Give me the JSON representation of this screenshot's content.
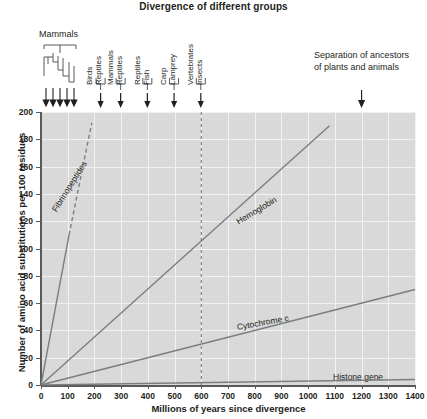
{
  "chart_data": {
    "type": "line",
    "title": "Divergence of different groups",
    "xlabel": "Millions of years since divergence",
    "ylabel": "Number of amino acid substitutions per 100 residues",
    "xlim": [
      0,
      1400
    ],
    "ylim": [
      0,
      200
    ],
    "xticks": [
      0,
      100,
      200,
      300,
      400,
      500,
      600,
      700,
      800,
      900,
      1000,
      1100,
      1200,
      1300,
      1400
    ],
    "yticks": [
      0,
      20,
      40,
      60,
      80,
      100,
      120,
      140,
      160,
      180,
      200
    ],
    "grid": true,
    "legend_position": "inline-labels",
    "series": [
      {
        "name": "Fibrinopeptides",
        "style": "solid-then-dashed",
        "solid_segment": [
          [
            0,
            0
          ],
          [
            105,
            110
          ]
        ],
        "dashed_segment": [
          [
            105,
            110
          ],
          [
            190,
            192
          ]
        ],
        "points": [
          [
            0,
            0
          ],
          [
            105,
            110
          ],
          [
            190,
            192
          ]
        ],
        "slope_per_100My": 104
      },
      {
        "name": "Hemoglobin",
        "style": "solid",
        "points": [
          [
            0,
            0
          ],
          [
            1080,
            190
          ]
        ],
        "slope_per_100My": 17.6
      },
      {
        "name": "Cytochrome c",
        "style": "solid",
        "points": [
          [
            0,
            0
          ],
          [
            1400,
            70
          ]
        ],
        "slope_per_100My": 5
      },
      {
        "name": "Histone gene",
        "style": "solid",
        "points": [
          [
            0,
            0
          ],
          [
            1400,
            4
          ]
        ],
        "slope_per_100My": 0.3
      }
    ],
    "reference_line": {
      "x": 600,
      "style": "dashed",
      "label": "Vertebrates / Insects divergence"
    },
    "divergence_markers": [
      {
        "x": 225,
        "labels": [
          "Birds",
          "Reptiles"
        ]
      },
      {
        "x": 300,
        "labels": [
          "Mammals",
          "Reptiles"
        ]
      },
      {
        "x": 400,
        "labels": [
          "Reptiles",
          "Fish"
        ]
      },
      {
        "x": 500,
        "labels": [
          "Carp",
          "Lamprey"
        ]
      },
      {
        "x": 600,
        "labels": [
          "Vertebrates",
          "Insects"
        ]
      },
      {
        "x": 1200,
        "labels": [
          "Separation of ancestors of plants and animals"
        ]
      }
    ],
    "mammals_cluster": {
      "label": "Mammals",
      "x_range": [
        10,
        80
      ],
      "tip_count": 5
    }
  },
  "annotations": {
    "mammals_caption": "Mammals",
    "separation_caption": "Separation of ancestors of plants and animals",
    "groups": [
      {
        "id": "birds-reptiles",
        "top_label": "Birds",
        "bottom_label": "Reptiles",
        "x_value": 225
      },
      {
        "id": "mammals-reptiles",
        "top_label": "Mammals",
        "bottom_label": "Reptiles",
        "x_value": 300
      },
      {
        "id": "reptiles-fish",
        "top_label": "Reptiles",
        "bottom_label": "Fish",
        "x_value": 400
      },
      {
        "id": "carp-lamprey",
        "top_label": "Carp",
        "bottom_label": "Lamprey",
        "x_value": 500
      },
      {
        "id": "vertebrates-insects",
        "top_label": "Vertebrates",
        "bottom_label": "Insects",
        "x_value": 600
      }
    ]
  },
  "series_labels": {
    "fibrinopeptides": "Fibrinopeptides",
    "hemoglobin": "Hemoglobin",
    "cytochrome_c": "Cytochrome c",
    "histone_gene": "Histone gene"
  },
  "axis": {
    "x_title": "Millions of years since divergence",
    "y_title": "Number of amino acid substitutions per 100 residues",
    "x_labels": [
      "0",
      "100",
      "200",
      "300",
      "400",
      "500",
      "600",
      "700",
      "800",
      "900",
      "1000",
      "1100",
      "1200",
      "1300",
      "1400"
    ],
    "y_labels": [
      "0",
      "20",
      "40",
      "60",
      "80",
      "100",
      "120",
      "140",
      "160",
      "180",
      "200"
    ]
  },
  "colors": {
    "plot_background": "#d9d9d9",
    "gridline": "#f2f2f2",
    "axis": "#58595b",
    "data_line": "#7b7e80",
    "text": "#231f20"
  }
}
